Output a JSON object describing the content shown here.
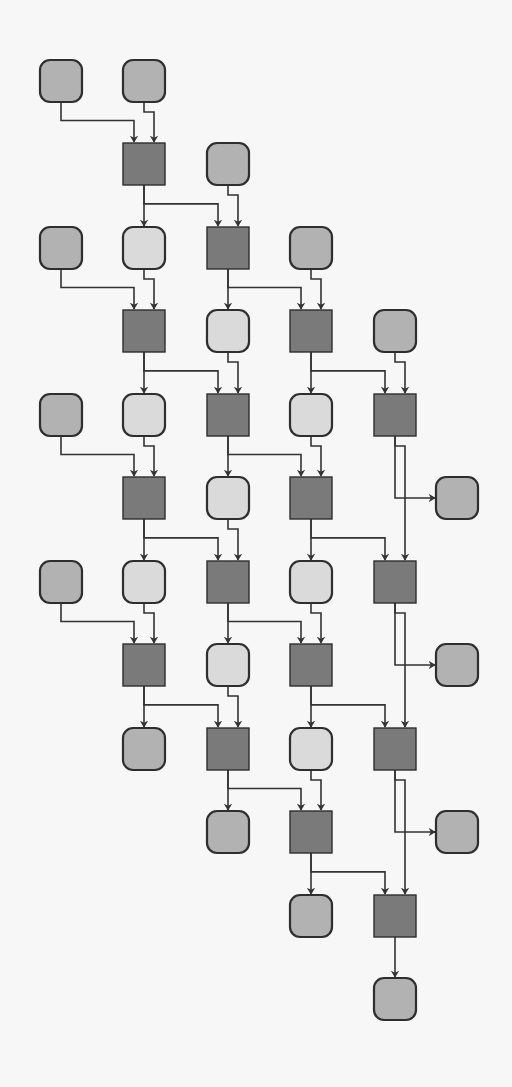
{
  "diagram": {
    "type": "grid-dataflow",
    "node_size": 42,
    "columns_x": [
      40,
      123,
      207,
      290,
      374,
      436
    ],
    "rows_y": [
      60,
      143,
      227,
      310,
      394,
      477,
      561,
      644,
      728,
      811,
      895,
      978
    ],
    "colors": {
      "background": "#f7f7f7",
      "input_node": "#b2b2b2",
      "intermediate_node": "#dadada",
      "operator_node": "#7a7a7a",
      "stroke": "#2e2e2e"
    },
    "nodes": [
      {
        "id": "n0_0",
        "r": 0,
        "c": 0,
        "kind": "med"
      },
      {
        "id": "n0_1",
        "r": 0,
        "c": 1,
        "kind": "med"
      },
      {
        "id": "n1_1",
        "r": 1,
        "c": 1,
        "kind": "sq"
      },
      {
        "id": "n1_2",
        "r": 1,
        "c": 2,
        "kind": "med"
      },
      {
        "id": "n2_0",
        "r": 2,
        "c": 0,
        "kind": "med"
      },
      {
        "id": "n2_1",
        "r": 2,
        "c": 1,
        "kind": "light"
      },
      {
        "id": "n2_2",
        "r": 2,
        "c": 2,
        "kind": "sq"
      },
      {
        "id": "n2_3",
        "r": 2,
        "c": 3,
        "kind": "med"
      },
      {
        "id": "n3_1",
        "r": 3,
        "c": 1,
        "kind": "sq"
      },
      {
        "id": "n3_2",
        "r": 3,
        "c": 2,
        "kind": "light"
      },
      {
        "id": "n3_3",
        "r": 3,
        "c": 3,
        "kind": "sq"
      },
      {
        "id": "n3_4",
        "r": 3,
        "c": 4,
        "kind": "med"
      },
      {
        "id": "n4_0",
        "r": 4,
        "c": 0,
        "kind": "med"
      },
      {
        "id": "n4_1",
        "r": 4,
        "c": 1,
        "kind": "light"
      },
      {
        "id": "n4_2",
        "r": 4,
        "c": 2,
        "kind": "sq"
      },
      {
        "id": "n4_3",
        "r": 4,
        "c": 3,
        "kind": "light"
      },
      {
        "id": "n4_4",
        "r": 4,
        "c": 4,
        "kind": "sq"
      },
      {
        "id": "n5_1",
        "r": 5,
        "c": 1,
        "kind": "sq"
      },
      {
        "id": "n5_2",
        "r": 5,
        "c": 2,
        "kind": "light"
      },
      {
        "id": "n5_3",
        "r": 5,
        "c": 3,
        "kind": "sq"
      },
      {
        "id": "n5_5",
        "r": 5,
        "c": 5,
        "kind": "med"
      },
      {
        "id": "n6_0",
        "r": 6,
        "c": 0,
        "kind": "med"
      },
      {
        "id": "n6_1",
        "r": 6,
        "c": 1,
        "kind": "light"
      },
      {
        "id": "n6_2",
        "r": 6,
        "c": 2,
        "kind": "sq"
      },
      {
        "id": "n6_3",
        "r": 6,
        "c": 3,
        "kind": "light"
      },
      {
        "id": "n6_4",
        "r": 6,
        "c": 4,
        "kind": "sq"
      },
      {
        "id": "n7_1",
        "r": 7,
        "c": 1,
        "kind": "sq"
      },
      {
        "id": "n7_2",
        "r": 7,
        "c": 2,
        "kind": "light"
      },
      {
        "id": "n7_3",
        "r": 7,
        "c": 3,
        "kind": "sq"
      },
      {
        "id": "n7_5",
        "r": 7,
        "c": 5,
        "kind": "med"
      },
      {
        "id": "n8_1",
        "r": 8,
        "c": 1,
        "kind": "med"
      },
      {
        "id": "n8_2",
        "r": 8,
        "c": 2,
        "kind": "sq"
      },
      {
        "id": "n8_3",
        "r": 8,
        "c": 3,
        "kind": "light"
      },
      {
        "id": "n8_4",
        "r": 8,
        "c": 4,
        "kind": "sq"
      },
      {
        "id": "n9_2",
        "r": 9,
        "c": 2,
        "kind": "med"
      },
      {
        "id": "n9_3",
        "r": 9,
        "c": 3,
        "kind": "sq"
      },
      {
        "id": "n9_5",
        "r": 9,
        "c": 5,
        "kind": "med"
      },
      {
        "id": "n10_3",
        "r": 10,
        "c": 3,
        "kind": "med"
      },
      {
        "id": "n10_4",
        "r": 10,
        "c": 4,
        "kind": "sq"
      },
      {
        "id": "n11_4",
        "r": 11,
        "c": 4,
        "kind": "med"
      }
    ],
    "edges": [
      [
        "n0_0",
        "n1_1",
        "L"
      ],
      [
        "n0_1",
        "n1_1",
        "R"
      ],
      [
        "n1_1",
        "n2_1",
        "D"
      ],
      [
        "n1_1",
        "n2_2",
        "L"
      ],
      [
        "n1_2",
        "n2_2",
        "R"
      ],
      [
        "n2_0",
        "n3_1",
        "L"
      ],
      [
        "n2_1",
        "n3_1",
        "R"
      ],
      [
        "n2_2",
        "n3_2",
        "D"
      ],
      [
        "n2_2",
        "n3_3",
        "L"
      ],
      [
        "n2_3",
        "n3_3",
        "R"
      ],
      [
        "n3_1",
        "n4_1",
        "D"
      ],
      [
        "n3_1",
        "n4_2",
        "L"
      ],
      [
        "n3_2",
        "n4_2",
        "R"
      ],
      [
        "n3_3",
        "n4_3",
        "D"
      ],
      [
        "n3_3",
        "n4_4",
        "L"
      ],
      [
        "n3_4",
        "n4_4",
        "R"
      ],
      [
        "n4_0",
        "n5_1",
        "L"
      ],
      [
        "n4_1",
        "n5_1",
        "R"
      ],
      [
        "n4_2",
        "n5_2",
        "D"
      ],
      [
        "n4_2",
        "n5_3",
        "L"
      ],
      [
        "n4_3",
        "n5_3",
        "R"
      ],
      [
        "n4_4",
        "n5_5",
        "O"
      ],
      [
        "n4_4",
        "n6_4",
        "R"
      ],
      [
        "n5_1",
        "n6_1",
        "D"
      ],
      [
        "n5_1",
        "n6_2",
        "L"
      ],
      [
        "n5_2",
        "n6_2",
        "R"
      ],
      [
        "n5_3",
        "n6_3",
        "D"
      ],
      [
        "n5_3",
        "n6_4",
        "L"
      ],
      [
        "n6_0",
        "n7_1",
        "L"
      ],
      [
        "n6_1",
        "n7_1",
        "R"
      ],
      [
        "n6_2",
        "n7_2",
        "D"
      ],
      [
        "n6_2",
        "n7_3",
        "L"
      ],
      [
        "n6_3",
        "n7_3",
        "R"
      ],
      [
        "n6_4",
        "n7_5",
        "O"
      ],
      [
        "n6_4",
        "n8_4",
        "R"
      ],
      [
        "n7_1",
        "n8_1",
        "D"
      ],
      [
        "n7_1",
        "n8_2",
        "L"
      ],
      [
        "n7_2",
        "n8_2",
        "R"
      ],
      [
        "n7_3",
        "n8_3",
        "D"
      ],
      [
        "n7_3",
        "n8_4",
        "L"
      ],
      [
        "n8_2",
        "n9_2",
        "D"
      ],
      [
        "n8_2",
        "n9_3",
        "L"
      ],
      [
        "n8_3",
        "n9_3",
        "R"
      ],
      [
        "n8_4",
        "n9_5",
        "O"
      ],
      [
        "n8_4",
        "n10_4",
        "R"
      ],
      [
        "n9_3",
        "n10_3",
        "D"
      ],
      [
        "n9_3",
        "n10_4",
        "L"
      ],
      [
        "n10_4",
        "n11_4",
        "D"
      ]
    ]
  }
}
